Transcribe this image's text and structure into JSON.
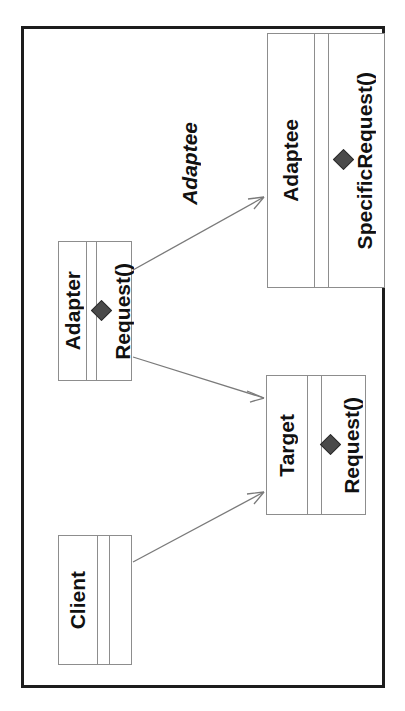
{
  "diagram": {
    "orientation": "rotated-90-clockwise",
    "frame_color": "#1d1d1d",
    "box_border_color": "#8d8d8d",
    "line_color": "#7a7a7a",
    "marker_color": "#4a4a4a",
    "classes": [
      {
        "id": "adaptee",
        "name": "Adaptee",
        "attributes": [],
        "operations": [
          {
            "marker": "filled-diamond-icon",
            "label": "SpecificRequest()"
          }
        ]
      },
      {
        "id": "adapter",
        "name": "Adapter",
        "attributes": [],
        "operations": [
          {
            "marker": "filled-diamond-icon",
            "label": "Request()"
          }
        ]
      },
      {
        "id": "target",
        "name": "Target",
        "attributes": [],
        "operations": [
          {
            "marker": "filled-diamond-icon",
            "label": "Request()"
          }
        ]
      },
      {
        "id": "client",
        "name": "Client",
        "attributes": [],
        "operations": []
      }
    ],
    "relations": [
      {
        "id": "adapter-to-adaptee",
        "from": "adapter",
        "to": "adaptee",
        "type": "association",
        "arrow": "open-arrow-icon",
        "label": "Adaptee"
      },
      {
        "id": "adapter-to-target",
        "from": "adapter",
        "to": "target",
        "type": "generalization",
        "arrow": "open-arrow-icon",
        "label": ""
      },
      {
        "id": "client-to-target",
        "from": "client",
        "to": "target",
        "type": "association",
        "arrow": "open-arrow-icon",
        "label": ""
      }
    ]
  }
}
